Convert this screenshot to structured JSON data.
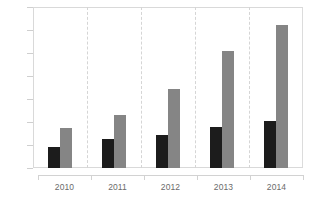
{
  "chart_data": {
    "type": "bar",
    "title": "",
    "subtitle": "",
    "xlabel": "",
    "ylabel": "",
    "categories": [
      "2010",
      "2011",
      "2012",
      "2013",
      "2014"
    ],
    "series": [
      {
        "name": "Series 1",
        "color": "#1c1c1c",
        "values": [
          180,
          250,
          290,
          360,
          410
        ]
      },
      {
        "name": "Series 2",
        "color": "#858585",
        "values": [
          350,
          460,
          690,
          1020,
          1240
        ]
      }
    ],
    "ylim": [
      0,
      1400
    ],
    "ytick_step": 200,
    "ytick_labels": [
      "0",
      "200",
      "400",
      "600",
      "800",
      "1,000",
      "1,200",
      "1,400"
    ],
    "ytick_values": [
      0,
      200,
      400,
      600,
      800,
      1000,
      1200,
      1400
    ],
    "grid": "vertical-dashed-category-separators",
    "legend": "none",
    "legend_position": "none",
    "plot_border_color": "#d9d9d9",
    "axis_text_color": "#6b6b6b",
    "background_color": "#ffffff"
  }
}
